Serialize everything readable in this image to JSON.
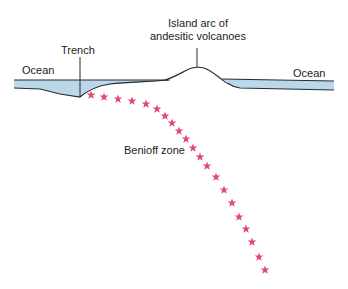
{
  "labels": {
    "ocean_left": "Ocean",
    "ocean_right": "Ocean",
    "trench": "Trench",
    "island_arc_line1": "Island arc of",
    "island_arc_line2": "andesitic volcanoes",
    "benioff_zone": "Benioff zone"
  },
  "colors": {
    "water": "#b9d9ea",
    "outline": "#2a2a2a",
    "star": "#e04a78",
    "text": "#222222"
  },
  "stars": [
    [
      91,
      95
    ],
    [
      104,
      97
    ],
    [
      118,
      99
    ],
    [
      132,
      101
    ],
    [
      146,
      104
    ],
    [
      157,
      109
    ],
    [
      165,
      116
    ],
    [
      172,
      123
    ],
    [
      179,
      131
    ],
    [
      186,
      139
    ],
    [
      193,
      148
    ],
    [
      200,
      157
    ],
    [
      207,
      166
    ],
    [
      216,
      177
    ],
    [
      224,
      190
    ],
    [
      232,
      203
    ],
    [
      239,
      217
    ],
    [
      246,
      229
    ],
    [
      252,
      242
    ],
    [
      259,
      257
    ],
    [
      265,
      270
    ]
  ]
}
